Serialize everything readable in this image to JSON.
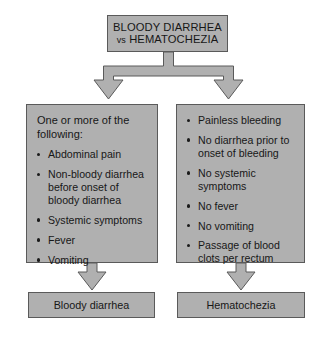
{
  "diagram": {
    "title_box": {
      "line1": "BLOODY DIARRHEA",
      "vs": "vs",
      "line2": "HEMATOCHEZIA"
    },
    "colors": {
      "box_fill": "#b0b0b0",
      "box_border": "#5a5a5a",
      "background": "#ffffff",
      "text": "#171717"
    },
    "branches": [
      {
        "id": "bloody-diarrhea",
        "intro": "One or more of the following:",
        "bullets": [
          "Abdominal pain",
          "Non-bloody diarrhea before onset of bloody diarrhea",
          "Systemic symptoms",
          "Fever",
          "Vomiting"
        ],
        "result": "Bloody diarrhea"
      },
      {
        "id": "hematochezia",
        "intro": "",
        "bullets": [
          "Painless bleeding",
          "No diarrhea prior to onset of bleeding",
          "No systemic symptoms",
          "No fever",
          "No vomiting",
          "Passage of blood clots per rectum"
        ],
        "result": "Hematochezia"
      }
    ]
  }
}
